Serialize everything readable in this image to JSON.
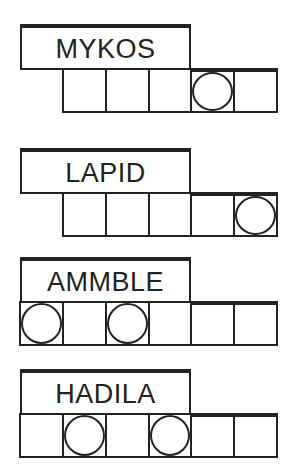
{
  "puzzles": [
    {
      "word": "MYKOS",
      "cells": 5,
      "circled": [
        4
      ]
    },
    {
      "word": "LAPID",
      "cells": 5,
      "circled": [
        5
      ]
    },
    {
      "word": "AMMBLE",
      "cells": 6,
      "circled": [
        1,
        3
      ]
    },
    {
      "word": "HADILA",
      "cells": 6,
      "circled": [
        2,
        4
      ]
    }
  ]
}
